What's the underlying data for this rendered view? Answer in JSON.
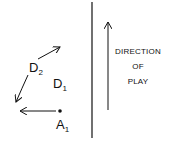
{
  "diagram": {
    "labels": {
      "d2": {
        "main": "D",
        "sub": "2"
      },
      "d1": {
        "main": "D",
        "sub": "1"
      },
      "a1": {
        "main": "A",
        "sub": "1"
      }
    },
    "direction_text": [
      "DIRECTION",
      "OF",
      "PLAY"
    ],
    "colors": {
      "ink": "#111111",
      "background": "#ffffff"
    }
  }
}
